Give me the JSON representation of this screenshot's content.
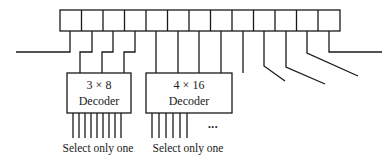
{
  "diagram": {
    "register": {
      "cell_count": 13
    },
    "decoders": [
      {
        "line1": "3 × 8",
        "line2": "Decoder",
        "footer": "Select only one"
      },
      {
        "line1": "4 × 16",
        "line2": "Decoder",
        "footer": "Select only one"
      }
    ],
    "ellipsis": "•••",
    "colors": {
      "stroke": "#1a1a1a",
      "background": "#ffffff"
    }
  }
}
